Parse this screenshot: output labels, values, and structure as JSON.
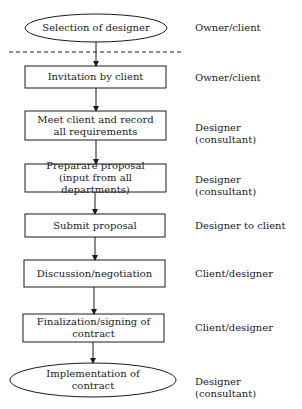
{
  "diagram": {
    "type": "flowchart",
    "direction": "top-to-bottom",
    "colors": {
      "stroke": "#1a1a1a",
      "background": "#ffffff",
      "text": "#222222"
    },
    "separator": {
      "style": "dashed",
      "position": "between step 1 and step 2"
    },
    "steps": [
      {
        "shape": "ellipse",
        "label": "Selection of designer",
        "role": "Owner/client"
      },
      {
        "shape": "rectangle",
        "label": "Invitation by client",
        "role": "Owner/client"
      },
      {
        "shape": "rectangle",
        "label": "Meet client and record all requirements",
        "role": "Designer (consultant)"
      },
      {
        "shape": "rectangle",
        "label": "Preparare proposal (input from all departments)",
        "role": "Designer (consultant)"
      },
      {
        "shape": "rectangle",
        "label": "Submit proposal",
        "role": "Designer to client"
      },
      {
        "shape": "rectangle",
        "label": "Discussion/negotiation",
        "role": "Client/designer"
      },
      {
        "shape": "rectangle",
        "label": "Finalization/signing of contract",
        "role": "Client/designer"
      },
      {
        "shape": "ellipse",
        "label": "Implementation of contract",
        "role": "Designer (consultant)"
      }
    ]
  }
}
